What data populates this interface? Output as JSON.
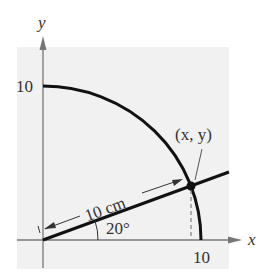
{
  "diagram": {
    "axes": {
      "x_label": "x",
      "y_label": "y",
      "x_tick": "10",
      "y_tick": "10"
    },
    "arc": {
      "radius_value": 10
    },
    "ray": {
      "length_label": "10 cm",
      "angle_label": "20°",
      "angle_degrees": 20
    },
    "point": {
      "label": "(x, y)"
    },
    "colors": {
      "background_shade": "#f1f1f1",
      "axis": "#777777",
      "curve": "#111111",
      "text": "#333333"
    }
  }
}
